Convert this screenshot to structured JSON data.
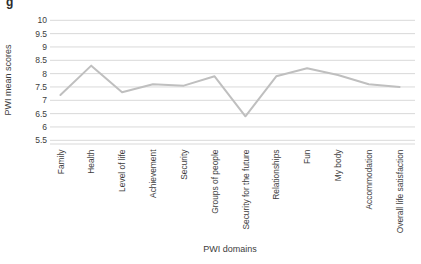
{
  "figure": {
    "corner_glyph": "g"
  },
  "chart_data": {
    "type": "line",
    "title": "",
    "xlabel": "PWI domains",
    "ylabel": "PWI mean scores",
    "categories": [
      "Family",
      "Health",
      "Level of life",
      "Achievement",
      "Security",
      "Groups of people",
      "Security for the future",
      "Relationships",
      "Fun",
      "My body",
      "Accommodation",
      "Overall life satisfaction"
    ],
    "values": [
      7.2,
      8.3,
      7.3,
      7.6,
      7.55,
      7.9,
      6.4,
      7.9,
      8.2,
      7.95,
      7.6,
      7.5
    ],
    "ylim": [
      5.5,
      10
    ],
    "ytick_step": 0.5,
    "ytick_labels": [
      "5.5",
      "6",
      "6.5",
      "7",
      "7.5",
      "8",
      "8.5",
      "9",
      "9.5",
      "10"
    ],
    "grid": "horizontal",
    "legend": "none",
    "line_color": "#bfbfbf",
    "grid_color": "#d9d9d9",
    "text_color": "#3d3d3d"
  }
}
